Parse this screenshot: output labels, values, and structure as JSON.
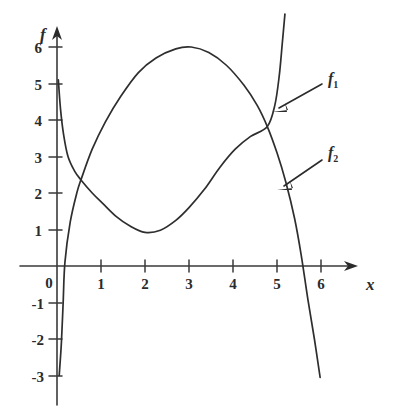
{
  "chart_data": {
    "type": "line",
    "title": "",
    "xlabel": "x",
    "ylabel": "f",
    "xlim": [
      -0.35,
      7.0
    ],
    "ylim": [
      -4.3,
      6.9
    ],
    "grid": false,
    "legend_position": "inline-annotations",
    "x_ticks": [
      0,
      1,
      2,
      3,
      4,
      5,
      6
    ],
    "x_tick_labels": [
      "0",
      "1",
      "2",
      "3",
      "4",
      "5",
      "6"
    ],
    "y_ticks": [
      6,
      5,
      4,
      3,
      2,
      1,
      -1,
      -2,
      -3
    ],
    "y_tick_labels": [
      "6",
      "5",
      "4",
      "3",
      "2",
      "1",
      "-1",
      "-2",
      "-3"
    ],
    "origin_label": "0",
    "annotations": [
      {
        "name": "f1",
        "label": "f",
        "subscript": "1",
        "points_to_x": 5.05,
        "points_to_y": 4.6
      },
      {
        "name": "f2",
        "label": "f",
        "subscript": "2",
        "points_to_x": 5.0,
        "points_to_y": 2.25
      }
    ],
    "series": [
      {
        "name": "f1",
        "label": "f",
        "subscript": "1",
        "description": "U-shaped curve, steep left branch from top of plot, minimum near x=2, steep rise exiting top right",
        "points": [
          [
            0.03,
            5.1
          ],
          [
            0.08,
            4.3
          ],
          [
            0.15,
            3.6
          ],
          [
            0.25,
            3.0
          ],
          [
            0.4,
            2.6
          ],
          [
            0.55,
            2.35
          ],
          [
            0.8,
            2.0
          ],
          [
            1.05,
            1.7
          ],
          [
            1.35,
            1.35
          ],
          [
            1.65,
            1.1
          ],
          [
            2.0,
            0.92
          ],
          [
            2.35,
            0.98
          ],
          [
            2.7,
            1.25
          ],
          [
            3.0,
            1.6
          ],
          [
            3.35,
            2.1
          ],
          [
            3.7,
            2.7
          ],
          [
            4.05,
            3.2
          ],
          [
            4.4,
            3.55
          ],
          [
            4.78,
            3.82
          ],
          [
            4.95,
            4.4
          ],
          [
            5.05,
            5.2
          ],
          [
            5.12,
            6.1
          ],
          [
            5.18,
            6.9
          ]
        ]
      },
      {
        "name": "f2",
        "label": "f",
        "subscript": "2",
        "description": "Arch curve rising from near origin to peak ~6 at x=3, descending through x-axis near x=5.6 down to about -3",
        "points": [
          [
            0.05,
            -3.0
          ],
          [
            0.1,
            -2.1
          ],
          [
            0.14,
            -1.0
          ],
          [
            0.18,
            0.1
          ],
          [
            0.3,
            1.2
          ],
          [
            0.45,
            2.0
          ],
          [
            0.55,
            2.38
          ],
          [
            0.8,
            3.2
          ],
          [
            1.1,
            3.95
          ],
          [
            1.45,
            4.65
          ],
          [
            1.85,
            5.3
          ],
          [
            2.25,
            5.7
          ],
          [
            2.7,
            5.95
          ],
          [
            3.05,
            6.0
          ],
          [
            3.45,
            5.85
          ],
          [
            3.85,
            5.5
          ],
          [
            4.25,
            4.95
          ],
          [
            4.55,
            4.4
          ],
          [
            4.78,
            3.82
          ],
          [
            5.0,
            3.1
          ],
          [
            5.2,
            2.3
          ],
          [
            5.4,
            1.3
          ],
          [
            5.55,
            0.3
          ],
          [
            5.7,
            -0.9
          ],
          [
            5.85,
            -2.0
          ],
          [
            5.98,
            -3.05
          ]
        ]
      }
    ],
    "intersections": [
      {
        "x": 0.55,
        "y": 2.38
      },
      {
        "x": 4.78,
        "y": 3.82
      }
    ]
  },
  "colors": {
    "ink": "#2e2e2e",
    "axis": "#3a3a3a",
    "background": "#ffffff"
  }
}
